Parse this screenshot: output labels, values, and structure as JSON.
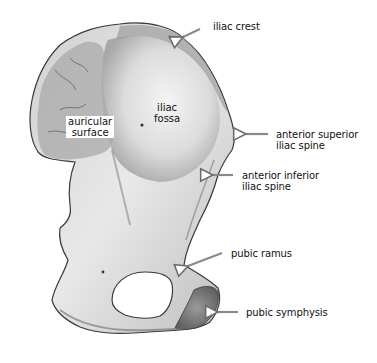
{
  "figure": {
    "labels": {
      "iliac_crest": [
        "iliac crest"
      ],
      "iliac_fossa": [
        "iliac",
        "fossa"
      ],
      "auricular_surface": [
        "auricular",
        "surface"
      ],
      "anterior_superior_iliac_spine": [
        "anterior superior",
        "iliac spine"
      ],
      "anterior_inferior_iliac_spine": [
        "anterior inferior",
        "iliac spine"
      ],
      "pubic_ramus": [
        "pubic ramus"
      ],
      "pubic_symphysis": [
        "pubic symphysis"
      ]
    },
    "colors": {
      "background": "#ffffff",
      "bone_light": "#e6e6e6",
      "bone_mid": "#b5b5b5",
      "bone_dark": "#6e6e6e",
      "outline": "#3a3a3a",
      "arrow": "#8a8a8a"
    }
  }
}
